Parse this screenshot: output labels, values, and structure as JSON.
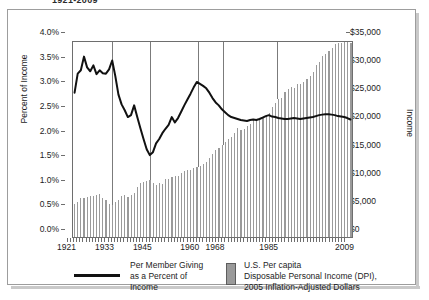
{
  "card": {
    "clipped_title": "1921-2009"
  },
  "axes": {
    "left_axis_label": "Percent of Income",
    "right_axis_label": "Income",
    "left_ticks": [
      "4.0%",
      "3.5%",
      "3.0%",
      "2.5%",
      "2.0%",
      "1.5%",
      "1.0%",
      "0.5%",
      "0.0%"
    ],
    "right_ticks": [
      "$35,000",
      "$30,000",
      "$25,000",
      "$20,000",
      "$15,000",
      "$10,000",
      "$5,000",
      "$0"
    ],
    "x_ticks": [
      "1921",
      "1933",
      "1945",
      "1960",
      "1968",
      "1985",
      "2009"
    ]
  },
  "legend": {
    "line_label": "Per Member Giving\nas a Percent of\nIncome",
    "line_label_lines": [
      "Per Member Giving",
      "as a Percent of",
      "Income"
    ],
    "bar_label_lines": [
      "U.S. Per capita",
      "Disposable Personal Income (DPI),",
      "2005 Inflation-Adjusted Dollars"
    ]
  },
  "colors": {
    "bar_fill": "#9a9a9a",
    "line_stroke": "#111111",
    "grid": "#7b7b7b",
    "axis": "#6e6e6e",
    "card_border": "#9d9d9d",
    "text": "#1c1c1c"
  },
  "chart_data": {
    "type": "line",
    "title": "1921-2009",
    "xlabel": "",
    "ylabel": "Percent of Income",
    "y2label": "Income",
    "ylim": [
      0,
      4.0
    ],
    "y2lim": [
      0,
      35000
    ],
    "xlim": [
      1921,
      2009
    ],
    "grid": "vertical gridlines at 1933, 1945, 1960, 1968, 1985",
    "gridlines_x": [
      1933,
      1945,
      1960,
      1968,
      1985
    ],
    "legend_position": "below-plot",
    "x": [
      1921,
      1922,
      1923,
      1924,
      1925,
      1926,
      1927,
      1928,
      1929,
      1930,
      1931,
      1932,
      1933,
      1934,
      1935,
      1936,
      1937,
      1938,
      1939,
      1940,
      1941,
      1942,
      1943,
      1944,
      1945,
      1946,
      1947,
      1948,
      1949,
      1950,
      1951,
      1952,
      1953,
      1954,
      1955,
      1956,
      1957,
      1958,
      1959,
      1960,
      1961,
      1962,
      1963,
      1964,
      1965,
      1966,
      1967,
      1968,
      1969,
      1970,
      1971,
      1972,
      1973,
      1974,
      1975,
      1976,
      1977,
      1978,
      1979,
      1980,
      1981,
      1982,
      1983,
      1984,
      1985,
      1986,
      1987,
      1988,
      1989,
      1990,
      1991,
      1992,
      1993,
      1994,
      1995,
      1996,
      1997,
      1998,
      1999,
      2000,
      2001,
      2002,
      2003,
      2004,
      2005,
      2006,
      2007,
      2008,
      2009
    ],
    "series": [
      {
        "name": "Per Member Giving as a Percent of Income",
        "type": "line",
        "axis": "left",
        "unit": "percent",
        "color": "#111111",
        "values": [
          2.96,
          3.35,
          3.42,
          3.7,
          3.48,
          3.4,
          3.52,
          3.34,
          3.42,
          3.36,
          3.35,
          3.44,
          3.62,
          3.3,
          2.92,
          2.72,
          2.6,
          2.46,
          2.5,
          2.7,
          2.46,
          2.23,
          2.01,
          1.8,
          1.68,
          1.74,
          1.92,
          2.01,
          2.13,
          2.22,
          2.3,
          2.46,
          2.35,
          2.44,
          2.57,
          2.7,
          2.82,
          2.94,
          3.07,
          3.18,
          3.14,
          3.1,
          3.05,
          2.96,
          2.85,
          2.76,
          2.7,
          2.62,
          2.56,
          2.5,
          2.46,
          2.44,
          2.42,
          2.4,
          2.39,
          2.38,
          2.4,
          2.41,
          2.4,
          2.42,
          2.45,
          2.48,
          2.5,
          2.47,
          2.46,
          2.44,
          2.43,
          2.42,
          2.42,
          2.43,
          2.44,
          2.43,
          2.42,
          2.43,
          2.44,
          2.45,
          2.46,
          2.48,
          2.5,
          2.51,
          2.52,
          2.52,
          2.51,
          2.5,
          2.48,
          2.47,
          2.46,
          2.44,
          2.41
        ]
      },
      {
        "name": "U.S. Per capita Disposable Personal Income (DPI), 2005 Inflation-Adjusted Dollars",
        "type": "bar",
        "axis": "right",
        "unit": "dollars",
        "color": "#9a9a9a",
        "values": [
          5900,
          6350,
          6950,
          7000,
          7150,
          7400,
          7450,
          7500,
          7650,
          7050,
          6700,
          5900,
          5750,
          6200,
          6700,
          7350,
          7500,
          7100,
          7500,
          7900,
          8900,
          9700,
          9800,
          10100,
          10300,
          9750,
          9300,
          9700,
          9600,
          10400,
          10500,
          10700,
          11000,
          10950,
          11500,
          11900,
          12000,
          12000,
          12350,
          12500,
          12750,
          13150,
          13450,
          14200,
          14900,
          15550,
          16050,
          16600,
          17050,
          17550,
          17900,
          18600,
          19600,
          19200,
          19400,
          19950,
          20350,
          21000,
          21250,
          21100,
          21500,
          21650,
          22200,
          23400,
          24000,
          24700,
          25000,
          25950,
          26500,
          26900,
          26800,
          27500,
          27500,
          27900,
          28400,
          28900,
          29600,
          30900,
          31500,
          32500,
          32800,
          33400,
          33900,
          34700,
          34800,
          34900,
          35500,
          35200,
          34900
        ]
      }
    ]
  }
}
